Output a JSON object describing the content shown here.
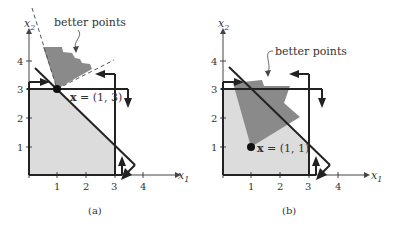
{
  "colors": {
    "feasible_fill": "#dcdcdc",
    "better_fill": "#8a8a8a",
    "line": "#222222",
    "background": "#ffffff"
  },
  "panels": [
    {
      "caption": "(a)",
      "x_axis_label": "x",
      "x_axis_sub": "1",
      "y_axis_label": "x",
      "y_axis_sub": "2",
      "x_ticks": [
        "1",
        "2",
        "3",
        "4"
      ],
      "y_ticks": [
        "1",
        "2",
        "3",
        "4"
      ],
      "point_label": "x = (1, 3)",
      "point_bold": "x",
      "point_rest": " = (1, 3)",
      "annotation": "better points"
    },
    {
      "caption": "(b)",
      "x_axis_label": "x",
      "x_axis_sub": "1",
      "y_axis_label": "x",
      "y_axis_sub": "2",
      "x_ticks": [
        "1",
        "2",
        "3",
        "4"
      ],
      "y_ticks": [
        "1",
        "2",
        "3",
        "4"
      ],
      "point_label": "x = (1, 1)",
      "point_bold": "x",
      "point_rest": " = (1, 1)",
      "annotation": "better points"
    }
  ]
}
